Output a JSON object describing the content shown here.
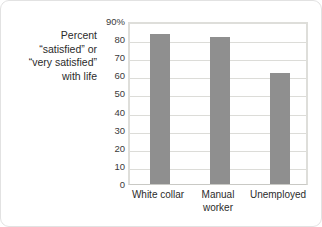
{
  "chart_data": {
    "type": "bar",
    "title": "",
    "xlabel": "",
    "ylabel": "Percent “satisfied” or “very satisfied” with life",
    "categories": [
      "White collar",
      "Manual worker",
      "Unemployed"
    ],
    "values": [
      83,
      81,
      61.5
    ],
    "ylim": [
      0,
      90
    ],
    "ytick_values": [
      0,
      10,
      20,
      30,
      40,
      50,
      60,
      70,
      80,
      90
    ],
    "ytick_labels": [
      "0",
      "10",
      "20",
      "30",
      "40",
      "50",
      "60",
      "70",
      "80",
      "90%"
    ],
    "grid": true,
    "legend": false,
    "legend_position": "none",
    "bar_color": "#8f8f8f",
    "plot_border_color": "#dededa",
    "gridline_color": "#dcdcd8"
  },
  "axis_caption": {
    "line1": "Percent",
    "line2": "“satisfied” or",
    "line3": "“very satisfied”",
    "line4": "with life"
  },
  "categories_display": [
    "White collar",
    "Manual\nworker",
    "Unemployed"
  ]
}
